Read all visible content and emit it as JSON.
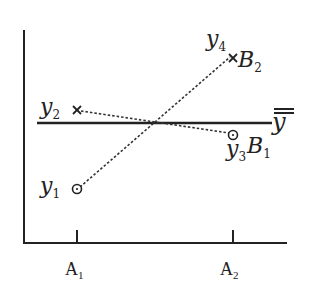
{
  "diagram": {
    "type": "interaction-plot",
    "x_axis": {
      "ticks": [
        {
          "label": "A",
          "sub": "1",
          "x": 77
        },
        {
          "label": "A",
          "sub": "2",
          "x": 233
        }
      ]
    },
    "grand_mean": {
      "label": "y",
      "y": 123
    },
    "points": [
      {
        "id": "y1",
        "label": "y",
        "sub": "1",
        "marker": "circle",
        "level": "A1",
        "group": "B1",
        "x": 77,
        "y": 189
      },
      {
        "id": "y2",
        "label": "y",
        "sub": "2",
        "marker": "cross",
        "level": "A1",
        "group": "B2",
        "x": 77,
        "y": 110
      },
      {
        "id": "y3",
        "label": "y",
        "sub": "3",
        "marker": "circle",
        "level": "A2",
        "group": "B1",
        "x": 233,
        "y": 135
      },
      {
        "id": "y4",
        "label": "y",
        "sub": "4",
        "marker": "cross",
        "level": "A2",
        "group": "B2",
        "x": 233,
        "y": 58
      }
    ],
    "series": [
      {
        "name": "B",
        "sub": "1",
        "from": "y1",
        "to": "y3"
      },
      {
        "name": "B",
        "sub": "2",
        "from": "y2",
        "to": "y4"
      }
    ],
    "labels": {
      "b1": {
        "main": "B",
        "sub": "1"
      },
      "b2": {
        "main": "B",
        "sub": "2"
      }
    }
  }
}
